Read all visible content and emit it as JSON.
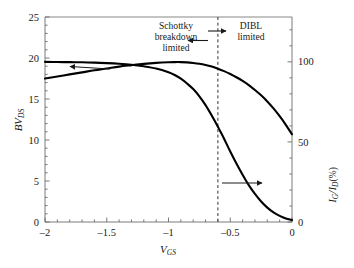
{
  "chart_data": {
    "type": "line",
    "title": "",
    "xlabel": "V_GS",
    "xlabel_main": "V",
    "xlabel_sub": "GS",
    "xlim": [
      -2,
      0
    ],
    "xticks": [
      -2,
      -1.5,
      -1,
      -0.5,
      0
    ],
    "xticklabels": [
      "–2",
      "–1.5",
      "–1",
      "–0.5",
      "0"
    ],
    "x_minor_step": 0.1,
    "grid": false,
    "legend": "none",
    "left_axis": {
      "label": "BV_DS",
      "label_main": "BV",
      "label_sub": "DS",
      "ylim": [
        0,
        25
      ],
      "yticks": [
        0,
        5,
        10,
        15,
        20,
        25
      ],
      "yticklabels": [
        "0",
        "5",
        "10",
        "15",
        "20",
        "25"
      ],
      "y_minor_step": 1
    },
    "right_axis": {
      "label": "I_G/I_D (%)",
      "label_num": "I",
      "label_num_sub": "G",
      "label_den": "I",
      "label_den_sub": "D",
      "label_unit": "(%)",
      "ylim": [
        0,
        128
      ],
      "yticks": [
        0,
        50,
        100
      ],
      "yticklabels": [
        "0",
        "50",
        "100"
      ],
      "y_minor_step": 10
    },
    "series": [
      {
        "name": "BV_DS",
        "axis": "left",
        "points": [
          [
            -2.0,
            17.5
          ],
          [
            -1.9,
            17.75
          ],
          [
            -1.8,
            18.0
          ],
          [
            -1.7,
            18.25
          ],
          [
            -1.6,
            18.5
          ],
          [
            -1.5,
            18.72
          ],
          [
            -1.4,
            18.95
          ],
          [
            -1.3,
            19.12
          ],
          [
            -1.2,
            19.28
          ],
          [
            -1.1,
            19.4
          ],
          [
            -1.0,
            19.48
          ],
          [
            -0.95,
            19.5
          ],
          [
            -0.9,
            19.5
          ],
          [
            -0.85,
            19.47
          ],
          [
            -0.8,
            19.4
          ],
          [
            -0.75,
            19.3
          ],
          [
            -0.7,
            19.15
          ],
          [
            -0.65,
            18.95
          ],
          [
            -0.6,
            18.7
          ],
          [
            -0.55,
            18.4
          ],
          [
            -0.5,
            18.05
          ],
          [
            -0.45,
            17.65
          ],
          [
            -0.4,
            17.2
          ],
          [
            -0.35,
            16.7
          ],
          [
            -0.3,
            16.1
          ],
          [
            -0.25,
            15.45
          ],
          [
            -0.2,
            14.7
          ],
          [
            -0.15,
            13.85
          ],
          [
            -0.1,
            12.9
          ],
          [
            -0.05,
            11.85
          ],
          [
            0.0,
            10.7
          ]
        ]
      },
      {
        "name": "I_G/I_D",
        "axis": "right",
        "points": [
          [
            -2.0,
            100.0
          ],
          [
            -1.9,
            99.9
          ],
          [
            -1.8,
            99.8
          ],
          [
            -1.7,
            99.7
          ],
          [
            -1.6,
            99.5
          ],
          [
            -1.5,
            99.2
          ],
          [
            -1.4,
            98.8
          ],
          [
            -1.3,
            98.2
          ],
          [
            -1.2,
            97.2
          ],
          [
            -1.1,
            95.8
          ],
          [
            -1.0,
            93.5
          ],
          [
            -0.95,
            91.8
          ],
          [
            -0.9,
            89.5
          ],
          [
            -0.85,
            86.5
          ],
          [
            -0.8,
            83.0
          ],
          [
            -0.75,
            78.5
          ],
          [
            -0.7,
            73.0
          ],
          [
            -0.65,
            66.5
          ],
          [
            -0.6,
            59.5
          ],
          [
            -0.58,
            56.5
          ],
          [
            -0.55,
            52.0
          ],
          [
            -0.5,
            44.0
          ],
          [
            -0.45,
            36.5
          ],
          [
            -0.4,
            29.5
          ],
          [
            -0.35,
            23.0
          ],
          [
            -0.3,
            17.5
          ],
          [
            -0.25,
            12.8
          ],
          [
            -0.2,
            9.0
          ],
          [
            -0.15,
            6.0
          ],
          [
            -0.1,
            3.8
          ],
          [
            -0.05,
            2.2
          ],
          [
            0.0,
            1.2
          ]
        ]
      }
    ],
    "annotations": [
      {
        "name": "schottky-region-label",
        "lines": [
          "Schottky",
          "breakdown",
          "limited"
        ],
        "x_px": 176,
        "y_px": 26
      },
      {
        "name": "dibl-region-label",
        "lines": [
          "DIBL",
          "limited"
        ],
        "x_px": 248,
        "y_px": 26
      }
    ],
    "divider": {
      "name": "region-divider",
      "x_value": -0.6,
      "style": "dashed"
    },
    "pointer_arrows": [
      {
        "name": "schottky-arrow",
        "direction": "left"
      },
      {
        "name": "dibl-arrow",
        "direction": "right"
      },
      {
        "name": "left-axis-pointer-arrow",
        "direction": "left"
      },
      {
        "name": "right-axis-pointer-arrow",
        "direction": "right"
      }
    ],
    "colors": {
      "curve": "#000000",
      "axis": "#595959",
      "text": "#1a1a1a",
      "divider": "#333333",
      "background": "#ffffff"
    }
  }
}
